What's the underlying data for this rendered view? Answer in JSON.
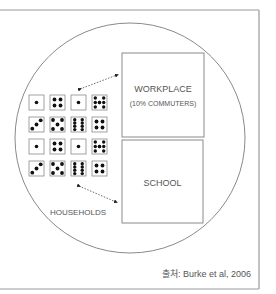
{
  "diagram": {
    "workplace": {
      "line1": "WORKPLACE",
      "line2": "(10% COMMUTERS)"
    },
    "school": {
      "label": "SCHOOL"
    },
    "households": {
      "label": "HOUSEHOLDS"
    },
    "caption": "출처: Burke et al, 2006",
    "dice_rows": [
      [
        1,
        4,
        1,
        8
      ],
      [
        3,
        5,
        8,
        4
      ],
      [
        1,
        4,
        1,
        8
      ],
      [
        3,
        5,
        8,
        4
      ]
    ],
    "colors": {
      "line": "#8a8a8a",
      "text": "#555555",
      "dot": "#111111"
    }
  }
}
